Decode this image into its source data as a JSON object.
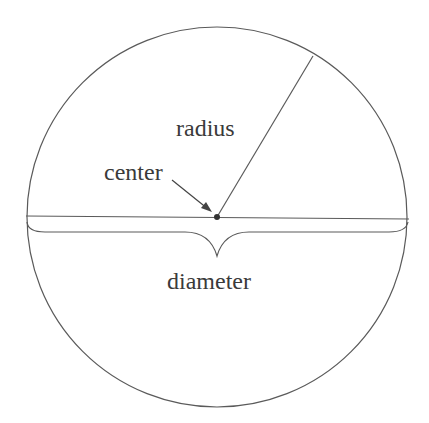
{
  "diagram": {
    "labels": {
      "radius": "radius",
      "center": "center",
      "diameter": "diameter"
    },
    "colors": {
      "stroke": "#5a5a5a",
      "text": "#3a3a3a",
      "background": "#ffffff"
    }
  }
}
